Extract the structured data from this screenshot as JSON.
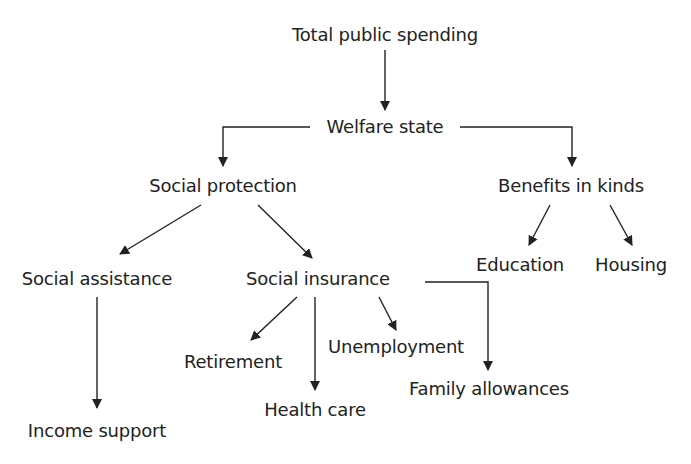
{
  "diagram": {
    "nodes": [
      {
        "id": "total",
        "label": "Total public spending",
        "x": 385,
        "y": 35
      },
      {
        "id": "welfare",
        "label": "Welfare state",
        "x": 385,
        "y": 127
      },
      {
        "id": "protection",
        "label": "Social protection",
        "x": 223,
        "y": 186
      },
      {
        "id": "benefits",
        "label": "Benefits in kinds",
        "x": 571,
        "y": 186
      },
      {
        "id": "education",
        "label": "Education",
        "x": 520,
        "y": 265
      },
      {
        "id": "housing",
        "label": "Housing",
        "x": 631,
        "y": 265
      },
      {
        "id": "assistance",
        "label": "Social assistance",
        "x": 97,
        "y": 279
      },
      {
        "id": "insurance",
        "label": "Social insurance",
        "x": 318,
        "y": 279
      },
      {
        "id": "retirement",
        "label": "Retirement",
        "x": 233,
        "y": 362
      },
      {
        "id": "unemployment",
        "label": "Unemployment",
        "x": 396,
        "y": 347
      },
      {
        "id": "health",
        "label": "Health care",
        "x": 315,
        "y": 410
      },
      {
        "id": "family",
        "label": "Family allowances",
        "x": 489,
        "y": 389
      },
      {
        "id": "income",
        "label": "Income support",
        "x": 97,
        "y": 431
      }
    ],
    "edges": [
      {
        "from": "total",
        "to": "welfare"
      },
      {
        "from": "welfare",
        "to": "protection"
      },
      {
        "from": "welfare",
        "to": "benefits"
      },
      {
        "from": "protection",
        "to": "assistance"
      },
      {
        "from": "protection",
        "to": "insurance"
      },
      {
        "from": "benefits",
        "to": "education"
      },
      {
        "from": "benefits",
        "to": "housing"
      },
      {
        "from": "assistance",
        "to": "income"
      },
      {
        "from": "insurance",
        "to": "retirement"
      },
      {
        "from": "insurance",
        "to": "health"
      },
      {
        "from": "insurance",
        "to": "unemployment"
      },
      {
        "from": "insurance",
        "to": "family"
      }
    ],
    "colors": {
      "text": "#222222",
      "line": "#222222",
      "background": "#ffffff"
    }
  }
}
